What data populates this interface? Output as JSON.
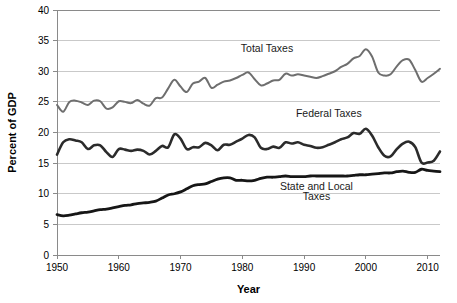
{
  "chart_data": {
    "type": "line",
    "title": "",
    "xlabel": "Year",
    "ylabel": "Percent of GDP",
    "xlim": [
      1950,
      2012
    ],
    "ylim": [
      0,
      40
    ],
    "ytick_labels": [
      "0",
      "5",
      "10",
      "15",
      "20",
      "25",
      "30",
      "35",
      "40"
    ],
    "yticks": [
      0,
      5,
      10,
      15,
      20,
      25,
      30,
      35,
      40
    ],
    "xtick_labels": [
      "1950",
      "1960",
      "1970",
      "1980",
      "1990",
      "2000",
      "2010"
    ],
    "xticks": [
      1950,
      1960,
      1970,
      1980,
      1990,
      2000,
      2010
    ],
    "grid": "horizontal",
    "legend_position": "inline-annotations",
    "annotations": [
      {
        "text": "Total Taxes",
        "x": 1984,
        "y": 33.2
      },
      {
        "text": "Federal Taxes",
        "x": 1994,
        "y": 22.6
      },
      {
        "text": "State and Local",
        "x": 1992,
        "y": 10.6
      },
      {
        "text": "Taxes",
        "x": 1992,
        "y": 8.9
      }
    ],
    "series": [
      {
        "name": "Total Taxes",
        "color": "#6e6e6e",
        "width": 2.0,
        "x": [
          1950,
          1951,
          1952,
          1953,
          1954,
          1955,
          1956,
          1957,
          1958,
          1959,
          1960,
          1961,
          1962,
          1963,
          1964,
          1965,
          1966,
          1967,
          1968,
          1969,
          1970,
          1971,
          1972,
          1973,
          1974,
          1975,
          1976,
          1977,
          1978,
          1979,
          1980,
          1981,
          1982,
          1983,
          1984,
          1985,
          1986,
          1987,
          1988,
          1989,
          1990,
          1991,
          1992,
          1993,
          1994,
          1995,
          1996,
          1997,
          1998,
          1999,
          2000,
          2001,
          2002,
          2003,
          2004,
          2005,
          2006,
          2007,
          2008,
          2009,
          2010,
          2011,
          2012
        ],
        "values": [
          24.5,
          23.4,
          25.0,
          25.2,
          24.9,
          24.5,
          25.2,
          25.1,
          23.9,
          24.1,
          25.1,
          25.0,
          24.8,
          25.3,
          24.7,
          24.4,
          25.6,
          25.7,
          27.2,
          28.6,
          27.5,
          26.6,
          28.0,
          28.3,
          28.9,
          27.3,
          27.8,
          28.3,
          28.5,
          28.9,
          29.4,
          29.8,
          28.7,
          27.7,
          28.0,
          28.5,
          28.6,
          29.6,
          29.3,
          29.5,
          29.3,
          29.1,
          28.9,
          29.2,
          29.6,
          30.0,
          30.7,
          31.2,
          32.1,
          32.5,
          33.6,
          32.4,
          29.8,
          29.3,
          29.5,
          30.8,
          31.8,
          31.9,
          30.2,
          28.3,
          28.9,
          29.6,
          30.4
        ]
      },
      {
        "name": "Federal Taxes",
        "color": "#2b2b2b",
        "width": 2.6,
        "x": [
          1950,
          1951,
          1952,
          1953,
          1954,
          1955,
          1956,
          1957,
          1958,
          1959,
          1960,
          1961,
          1962,
          1963,
          1964,
          1965,
          1966,
          1967,
          1968,
          1969,
          1970,
          1971,
          1972,
          1973,
          1974,
          1975,
          1976,
          1977,
          1978,
          1979,
          1980,
          1981,
          1982,
          1983,
          1984,
          1985,
          1986,
          1987,
          1988,
          1989,
          1990,
          1991,
          1992,
          1993,
          1994,
          1995,
          1996,
          1997,
          1998,
          1999,
          2000,
          2001,
          2002,
          2003,
          2004,
          2005,
          2006,
          2007,
          2008,
          2009,
          2010,
          2011,
          2012
        ],
        "values": [
          16.4,
          18.4,
          18.9,
          18.7,
          18.4,
          17.3,
          17.9,
          17.9,
          16.8,
          16.0,
          17.3,
          17.2,
          17.0,
          17.2,
          17.0,
          16.4,
          17.0,
          17.8,
          17.6,
          19.7,
          19.0,
          17.3,
          17.6,
          17.6,
          18.3,
          17.9,
          17.1,
          18.0,
          18.0,
          18.5,
          19.0,
          19.6,
          19.2,
          17.5,
          17.3,
          17.7,
          17.5,
          18.4,
          18.2,
          18.4,
          18.0,
          17.8,
          17.5,
          17.6,
          18.0,
          18.4,
          18.9,
          19.2,
          19.9,
          19.8,
          20.6,
          19.5,
          17.6,
          16.2,
          16.1,
          17.3,
          18.2,
          18.5,
          17.6,
          15.1,
          15.1,
          15.4,
          16.9
        ]
      },
      {
        "name": "State and Local Taxes",
        "color": "#161616",
        "width": 2.8,
        "x": [
          1950,
          1951,
          1952,
          1953,
          1954,
          1955,
          1956,
          1957,
          1958,
          1959,
          1960,
          1961,
          1962,
          1963,
          1964,
          1965,
          1966,
          1967,
          1968,
          1969,
          1970,
          1971,
          1972,
          1973,
          1974,
          1975,
          1976,
          1977,
          1978,
          1979,
          1980,
          1981,
          1982,
          1983,
          1984,
          1985,
          1986,
          1987,
          1988,
          1989,
          1990,
          1991,
          1992,
          1993,
          1994,
          1995,
          1996,
          1997,
          1998,
          1999,
          2000,
          2001,
          2002,
          2003,
          2004,
          2005,
          2006,
          2007,
          2008,
          2009,
          2010,
          2011,
          2012
        ],
        "values": [
          6.6,
          6.4,
          6.5,
          6.7,
          6.9,
          7.0,
          7.2,
          7.4,
          7.5,
          7.7,
          7.9,
          8.1,
          8.2,
          8.4,
          8.5,
          8.6,
          8.8,
          9.3,
          9.8,
          10.0,
          10.3,
          10.8,
          11.3,
          11.5,
          11.6,
          12.0,
          12.4,
          12.6,
          12.6,
          12.2,
          12.2,
          12.1,
          12.2,
          12.5,
          12.7,
          12.7,
          12.8,
          12.9,
          12.8,
          12.8,
          12.8,
          12.9,
          12.9,
          12.9,
          12.9,
          12.9,
          12.9,
          12.9,
          13.0,
          13.1,
          13.1,
          13.2,
          13.3,
          13.4,
          13.4,
          13.6,
          13.7,
          13.5,
          13.5,
          14.0,
          13.8,
          13.7,
          13.6
        ]
      }
    ]
  }
}
